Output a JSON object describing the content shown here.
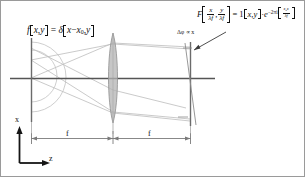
{
  "figure": {
    "domain": "Diagram",
    "background_color": "#ffffff",
    "width": 305,
    "height": 177
  },
  "colors": {
    "ink": "#111111",
    "axis": "#000000",
    "optical_axis": "#4d4d4d",
    "plane_line": "#6b6b6b",
    "ray": "#b9b9b9",
    "lens_fill": "#b3b3b3",
    "lens_edge": "#8a8a8a",
    "wavefront": "#bdbdbd",
    "dimension_line": "#7a7a7a",
    "arrow": "#3a3a3a",
    "border": "#9a9a9a"
  },
  "source_plane": {
    "formula_parts": {
      "function_symbol": "f",
      "arg_x": "x",
      "arg_y": "y",
      "equals": "=",
      "delta_symbol": "δ",
      "delta_arg_x": "x",
      "minus": "−",
      "x_offset": "x",
      "x_offset_sub": "0",
      "delta_arg_y": "y",
      "comma": ","
    },
    "plain_text": "f[x,y] = δ[x − x₀, y]"
  },
  "output_plane": {
    "formula_parts": {
      "F_symbol": "F",
      "num_x": "x",
      "den_x": "λf",
      "num_y": "y",
      "den_y": "λf",
      "comma": ",",
      "equals": "=",
      "one": "1",
      "arg_x": "x",
      "arg_y": "y",
      "dot": "·",
      "e_symbol": "e",
      "exp_prefix": "−2πi",
      "exp_num": "x",
      "exp_num_sub": "0",
      "exp_num_x": "x",
      "exp_den": "λf"
    },
    "plain_text": "F[x/λf, y/λf] = 1[x,y] · e^(−2πi(x₀x/λf))"
  },
  "annotations": {
    "phase_note": "Δφ ∝ x",
    "phase_note_plain": "Δφ ∝ x"
  },
  "axes": {
    "x_label": "x",
    "z_label": "z"
  },
  "dimensions": {
    "segment_1_label": "f",
    "segment_2_label": "f"
  },
  "elements": {
    "source_plane_name": "input-plane",
    "lens_name": "converging-lens",
    "output_plane_name": "fourier-plane",
    "wavefront_name": "diverging-spherical-wavefront",
    "tilted_phase_name": "tilted-phase-front"
  }
}
